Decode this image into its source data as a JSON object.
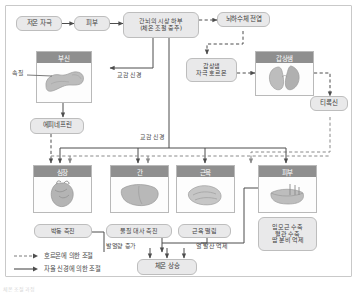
{
  "diagram": {
    "title": "체온 조절 과정",
    "nodes": {
      "stimulus": "저온 자극",
      "skin_sensor": "피부",
      "hypothalamus_l1": "간뇌의 시상 하부",
      "hypothalamus_l2": "(체온 조절 중추)",
      "pituitary": "뇌하수체 전엽",
      "tsh_l1": "갑상샘",
      "tsh_l2": "자극 호르몬",
      "thyroid": "갑상샘",
      "thyroxine": "티록신",
      "adrenal": "부신",
      "medulla": "속질",
      "epinephrine": "에피네프린",
      "heart": "심장",
      "liver": "간",
      "muscle": "근육",
      "skin": "피부",
      "heart_effect": "박동 촉진",
      "liver_effect": "물질 대사 촉진",
      "muscle_effect": "근육 떨림",
      "skin_effect_l1": "입모근 수축",
      "skin_effect_l2": "혈관 수축",
      "skin_effect_l3": "땀 분비 억제",
      "heat_production": "발열량 증가",
      "heat_loss": "열 발산 억제",
      "result": "체온 상승"
    },
    "edge_labels": {
      "sympathetic_adrenal": "교감 신경",
      "sympathetic_organs": "교감 신경"
    },
    "legend": [
      {
        "style": "dashed",
        "label": "호르몬에 의한 조절"
      },
      {
        "style": "solid",
        "label": "자율 신경에 의한 조절"
      }
    ],
    "colors": {
      "pill_fill": "#e9e9ea",
      "pill_border": "#bdbdbd",
      "card_header": "#8f8f8f",
      "card_border": "#b9b9b9",
      "line": "#5a5a5a",
      "text": "#3d3d3d",
      "organ_tissue": "#b5b5b5"
    }
  }
}
